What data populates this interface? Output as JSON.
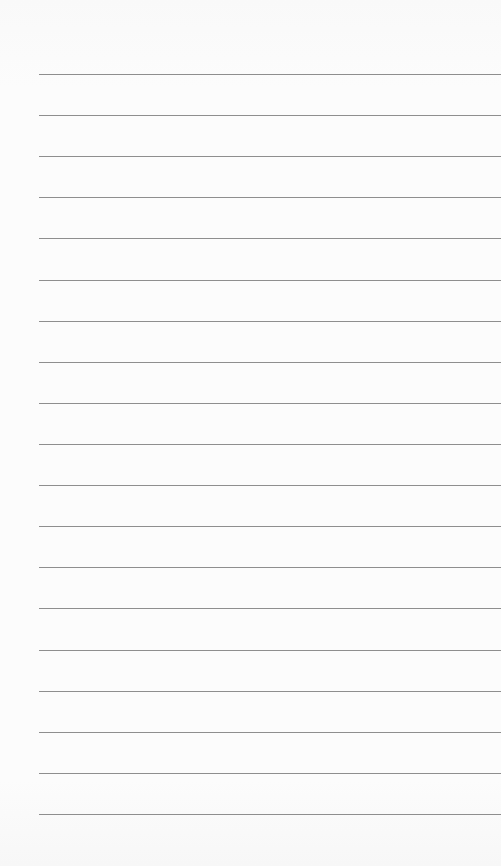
{
  "page": {
    "type": "lined-notepad-page",
    "line_count": 19,
    "rule_color": "#8e8e8e",
    "background_color": "#fbfbfb",
    "lines": [
      "",
      "",
      "",
      "",
      "",
      "",
      "",
      "",
      "",
      "",
      "",
      "",
      "",
      "",
      "",
      "",
      "",
      "",
      ""
    ]
  }
}
